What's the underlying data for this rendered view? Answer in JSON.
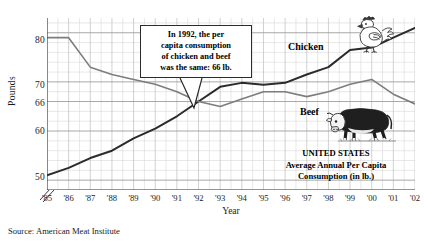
{
  "chart_data": {
    "type": "line",
    "title": "UNITED STATES Average Annual Per Capita Consumption (in lb.)",
    "xlabel": "Year",
    "ylabel": "Pounds",
    "categories": [
      "'85",
      "'86",
      "'87",
      "'88",
      "'89",
      "'90",
      "'91",
      "'92",
      "'93",
      "'94",
      "'95",
      "'96",
      "'97",
      "'98",
      "'99",
      "'00",
      "'01",
      "'02"
    ],
    "x_values": [
      1985,
      1986,
      1987,
      1988,
      1989,
      1990,
      1991,
      1992,
      1993,
      1994,
      1995,
      1996,
      1997,
      1998,
      1999,
      2000,
      2001,
      2002
    ],
    "ylim": [
      48,
      83
    ],
    "xlim": [
      "'85",
      "'02"
    ],
    "y_ticks": [
      50,
      60,
      66,
      70,
      80
    ],
    "y_axis_break": true,
    "grid": true,
    "legend": "inline-labels",
    "series": [
      {
        "name": "Chicken",
        "color": "#2b2b2b",
        "values": [
          51,
          52.5,
          54.5,
          56,
          58.5,
          60.5,
          63,
          66,
          69,
          69.8,
          69.4,
          69.8,
          71.5,
          73,
          76.5,
          77,
          79,
          81
        ]
      },
      {
        "name": "Beef",
        "color": "#7d7d7d",
        "values": [
          79,
          79,
          73,
          71.5,
          70.5,
          69.5,
          68,
          66,
          65,
          66.5,
          68,
          68,
          67,
          68,
          69.5,
          70.5,
          67.5,
          65.5
        ]
      }
    ],
    "annotations": [
      {
        "name": "callout",
        "text": "In 1992, the per capita consumption of chicken and beef was the same: 66 lb.",
        "target_x": "'92",
        "target_y": 66
      }
    ]
  },
  "yaxis": {
    "label": "Pounds",
    "ticks": [
      {
        "value": 80,
        "label": "80"
      },
      {
        "value": 70,
        "label": "70"
      },
      {
        "value": 66,
        "label": "66"
      },
      {
        "value": 60,
        "label": "60"
      },
      {
        "value": 50,
        "label": "50"
      }
    ]
  },
  "xaxis": {
    "label": "Year",
    "ticks": [
      "'85",
      "'86",
      "'87",
      "'88",
      "'89",
      "'90",
      "'91",
      "'92",
      "'93",
      "'94",
      "'95",
      "'96",
      "'97",
      "'98",
      "'99",
      "'00",
      "'01",
      "'02"
    ]
  },
  "callout": {
    "line1": "In 1992, the per",
    "line2": "capita consumption",
    "line3": "of chicken and beef",
    "line4": "was the same: 66 lb.",
    "full_text": "In 1992, the per capita consumption of chicken and beef was the same: 66 lb."
  },
  "series_labels": {
    "chicken": "Chicken",
    "beef": "Beef"
  },
  "caption": {
    "line1": "UNITED STATES",
    "line2": "Average Annual Per Capita",
    "line3": "Consumption (in lb.)"
  },
  "source": {
    "text": "Source: American Meat Institute"
  },
  "colors": {
    "chicken_line": "#2b2b2b",
    "beef_line": "#7d7d7d",
    "grid_major": "#9a9a9a",
    "grid_minor": "#d8d8d8",
    "axis": "#3a3a3a",
    "text": "#1a1a1a",
    "callout_border": "#2b2b2b"
  }
}
